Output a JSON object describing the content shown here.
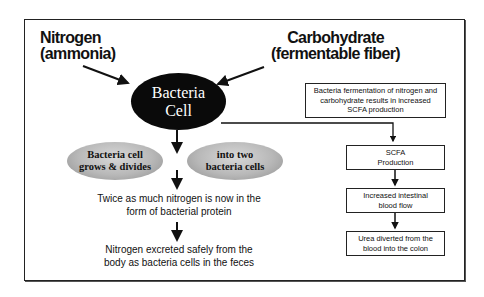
{
  "diagram": {
    "inputs": {
      "nitrogen": {
        "line1": "Nitrogen",
        "line2": "(ammonia)"
      },
      "carbohydrate": {
        "line1": "Carbohydrate",
        "line2": "(fermentable fiber)"
      }
    },
    "center_node": {
      "line1": "Bacteria",
      "line2": "Cell"
    },
    "left_branch": {
      "oval_left": {
        "line1": "Bacteria cell",
        "line2": "grows & divides"
      },
      "oval_right": {
        "line1": "into two",
        "line2": "bacteria cells"
      },
      "step1": {
        "line1": "Twice as much nitrogen is now in the",
        "line2": "form of bacterial protein"
      },
      "step2": {
        "line1": "Nitrogen excreted safely from the",
        "line2": "body as bacteria cells in the feces"
      }
    },
    "right_branch": {
      "summary_box": {
        "line1": "Bacteria fermentation of nitrogen and",
        "line2": "carbohydrate results in increased",
        "line3": "SCFA production"
      },
      "box1": {
        "line1": "SCFA",
        "line2": "Production"
      },
      "box2": {
        "line1": "Increased intestinal",
        "line2": "blood flow"
      },
      "box3": {
        "line1": "Urea diverted from the",
        "line2": "blood into the colon"
      }
    },
    "colors": {
      "frame": "#222222",
      "dark_node": "#0a0a0a",
      "grey_oval": "#b8b8b8",
      "text": "#111111"
    }
  }
}
